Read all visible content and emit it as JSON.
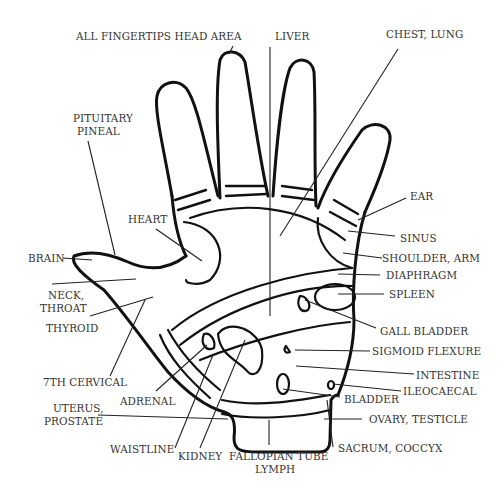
{
  "diagram": {
    "labels": {
      "all_fingertips": "ALL FINGERTIPS HEAD AREA",
      "liver": "LIVER",
      "chest_lung": "CHEST, LUNG",
      "pituitary_1": "PITUITARY",
      "pituitary_2": "PINEAL",
      "ear": "EAR",
      "heart": "HEART",
      "sinus": "SINUS",
      "brain": "BRAIN",
      "shoulder_arm": "SHOULDER, ARM",
      "neck_1": "NECK,",
      "neck_2": "THROAT",
      "diaphragm": "DIAPHRAGM",
      "spleen": "SPLEEN",
      "thyroid": "THYROID",
      "gall_bladder": "GALL BLADDER",
      "sigmoid_flexure": "SIGMOID FLEXURE",
      "seventh_cervical": "7TH CERVICAL",
      "intestine": "INTESTINE",
      "adrenal": "ADRENAL",
      "ileocaecal": "ILEOCAECAL",
      "bladder": "BLADDER",
      "uterus_1": "UTERUS,",
      "uterus_2": "PROSTATE",
      "ovary_testicle": "OVARY, TESTICLE",
      "waistline": "WAISTLINE",
      "kidney": "KIDNEY",
      "fallopian_1": "FALLOPIAN TUBE",
      "fallopian_2": "LYMPH",
      "sacrum_coccyx": "SACRUM, COCCYX"
    }
  }
}
